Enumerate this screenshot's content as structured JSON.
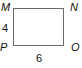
{
  "diagram": {
    "shape": "rectangle",
    "vertices": {
      "top_left": "M",
      "top_right": "N",
      "bottom_right": "O",
      "bottom_left": "P"
    },
    "side_labels": {
      "left": "4",
      "bottom": "6"
    },
    "stroke_color": "#6b6b6b"
  }
}
